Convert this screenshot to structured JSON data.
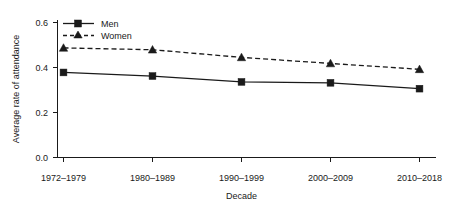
{
  "chart_data": {
    "type": "line",
    "title": "",
    "xlabel": "Decade",
    "ylabel": "Average rate of attendance",
    "categories": [
      "1972–1979",
      "1980–1989",
      "1990–1999",
      "2000–2009",
      "2010–2018"
    ],
    "series": [
      {
        "name": "Men",
        "marker": "square",
        "linestyle": "solid",
        "color": "#1a1a1a",
        "values": [
          0.378,
          0.362,
          0.336,
          0.332,
          0.306
        ]
      },
      {
        "name": "Women",
        "marker": "triangle",
        "linestyle": "dashed",
        "color": "#1a1a1a",
        "values": [
          0.487,
          0.479,
          0.445,
          0.418,
          0.392
        ]
      }
    ],
    "ylim": [
      0.0,
      0.62
    ],
    "yticks": [
      0.0,
      0.2,
      0.4,
      0.6
    ],
    "ytick_labels": [
      "0.0",
      "0.2",
      "0.4",
      "0.6"
    ],
    "grid": false,
    "legend_position": "top-left"
  },
  "axes": {
    "y_title": "Average rate of attendance",
    "x_title": "Decade",
    "y_ticks": [
      "0.0",
      "0.2",
      "0.4",
      "0.6"
    ],
    "x_ticks": [
      "1972–1979",
      "1980–1989",
      "1990–1999",
      "2000–2009",
      "2010–2018"
    ]
  },
  "legend": {
    "entries": [
      {
        "label": "Men"
      },
      {
        "label": "Women"
      }
    ]
  }
}
